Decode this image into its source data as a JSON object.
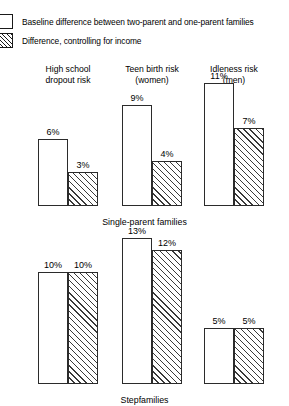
{
  "legend": {
    "items": [
      {
        "label": "Baseline difference between two-parent and one-parent families",
        "swatch": "open-square-swatch",
        "style": "open"
      },
      {
        "label": "Difference, controlling for income",
        "swatch": "hatched-square-swatch",
        "style": "hatched"
      }
    ]
  },
  "columns": [
    {
      "line1": "High school",
      "line2": "dropout risk"
    },
    {
      "line1": "Teen birth risk",
      "line2": "(women)"
    },
    {
      "line1": "Idleness risk",
      "line2": "(men)"
    }
  ],
  "panels": [
    {
      "label": "Single-parent families",
      "groups": [
        {
          "baseline": "6%",
          "controlled": "3%"
        },
        {
          "baseline": "9%",
          "controlled": "4%"
        },
        {
          "baseline": "11%",
          "controlled": "7%"
        }
      ]
    },
    {
      "label": "Stepfamilies",
      "groups": [
        {
          "baseline": "10%",
          "controlled": "10%"
        },
        {
          "baseline": "13%",
          "controlled": "12%"
        },
        {
          "baseline": "5%",
          "controlled": "5%"
        }
      ]
    }
  ],
  "colors": {
    "ink": "#1a1a1a",
    "bar_outline": "#2b2b2b",
    "hatch": "#3a3a3a",
    "background": "#ffffff"
  },
  "chart_data": {
    "type": "bar",
    "title": "",
    "xlabel": "",
    "ylabel": "",
    "ylim": [
      0,
      13
    ],
    "grid": false,
    "legend_position": "top-left",
    "unit": "%",
    "categories": [
      "High school dropout risk",
      "Teen birth risk (women)",
      "Idleness risk (men)"
    ],
    "panels": [
      {
        "name": "Single-parent families",
        "series": [
          {
            "name": "Baseline difference between two-parent and one-parent families",
            "values": [
              6,
              9,
              11
            ]
          },
          {
            "name": "Difference, controlling for income",
            "values": [
              3,
              4,
              7
            ]
          }
        ]
      },
      {
        "name": "Stepfamilies",
        "series": [
          {
            "name": "Baseline difference between two-parent and one-parent families",
            "values": [
              10,
              13,
              5
            ]
          },
          {
            "name": "Difference, controlling for income",
            "values": [
              10,
              12,
              5
            ]
          }
        ]
      }
    ]
  }
}
